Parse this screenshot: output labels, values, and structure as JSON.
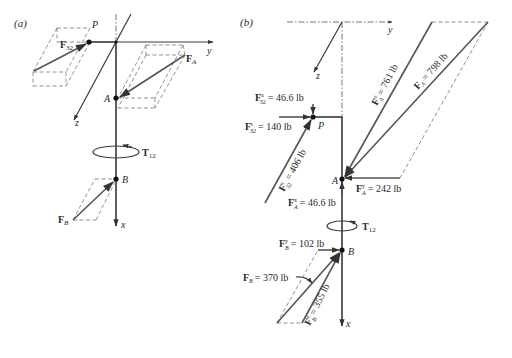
{
  "panels": {
    "a": {
      "label": "(a)",
      "axes": {
        "x": "x",
        "y": "y",
        "z": "z"
      },
      "points": {
        "P": "P",
        "A": "A",
        "B": "B"
      },
      "forces": {
        "F32": {
          "main": "F",
          "sub": "32"
        },
        "FA": {
          "main": "F",
          "sub": "A"
        },
        "FB": {
          "main": "F",
          "sub": "B"
        }
      },
      "torque": {
        "main": "T",
        "sub": "12"
      }
    },
    "b": {
      "label": "(b)",
      "axes": {
        "x": "x",
        "y": "y",
        "z": "z"
      },
      "points": {
        "P": "P",
        "A": "A",
        "B": "B"
      },
      "forces": {
        "F32a": {
          "main": "F",
          "sup": "a",
          "sub": "32",
          "value": "= 46.6 lb"
        },
        "F32r": {
          "main": "F",
          "sup": "r",
          "sub": "32",
          "value": "= 140 lb"
        },
        "F32t": {
          "main": "F",
          "sup": "t",
          "sub": "32",
          "value": "= 406 lb"
        },
        "FAz": {
          "main": "F",
          "sup": "z",
          "sub": "A",
          "value": "= 761 lb"
        },
        "FA": {
          "main": "F",
          "sub": "A",
          "value": "= 798 lb"
        },
        "FAy": {
          "main": "F",
          "sup": "y",
          "sub": "A",
          "value": "= 242 lb"
        },
        "FAx": {
          "main": "F",
          "sup": "x",
          "sub": "A",
          "value": "= 46.6 lb"
        },
        "FBy": {
          "main": "F",
          "sup": "y",
          "sub": "B",
          "value": "= 102 lb"
        },
        "FB": {
          "main": "F",
          "sub": "B",
          "value": "= 370 lb"
        },
        "FBz": {
          "main": "F",
          "sup": "z",
          "sub": "B",
          "value": "= 355 lb"
        }
      },
      "torque": {
        "main": "T",
        "sub": "12"
      }
    }
  },
  "colors": {
    "line": "#2a2a2a",
    "vector": "#555555",
    "dashed": "#777777",
    "background": "#ffffff"
  }
}
